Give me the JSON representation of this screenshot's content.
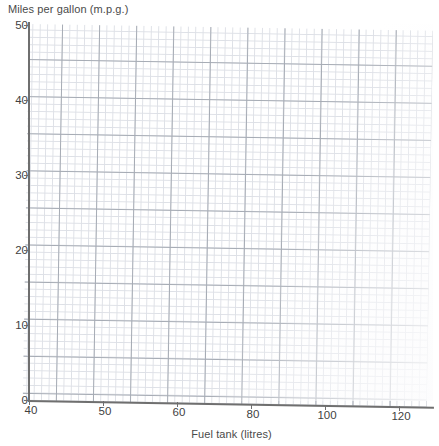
{
  "chart_data": {
    "type": "line",
    "title": "",
    "ylabel": "Miles per gallon (m.p.g.)",
    "xlabel": "Fuel tank (litres)",
    "grid": true,
    "legend": false,
    "series": [],
    "values": [],
    "x": [],
    "categories": [],
    "xlim": [
      40,
      130
    ],
    "ylim": [
      0,
      50
    ],
    "y_ticks": [
      {
        "label": "50",
        "value": 50,
        "top_px": 19
      },
      {
        "label": "40",
        "value": 40,
        "top_px": 94
      },
      {
        "label": "30",
        "value": 30,
        "top_px": 169
      },
      {
        "label": "20",
        "value": 20,
        "top_px": 244
      },
      {
        "label": "10",
        "value": 10,
        "top_px": 319
      },
      {
        "label": "0",
        "value": 0,
        "top_px": 394
      }
    ],
    "x_ticks": [
      {
        "label": "40",
        "value": 40,
        "left_px": 29
      },
      {
        "label": "50",
        "value": 50,
        "left_px": 103
      },
      {
        "label": "60",
        "value": 60,
        "left_px": 177
      },
      {
        "label": "80",
        "value": 80,
        "left_px": 251
      },
      {
        "label": "100",
        "value": 100,
        "left_px": 325
      },
      {
        "label": "120",
        "value": 120,
        "left_px": 399
      }
    ],
    "grid_colors": {
      "minor": "#d9dce3",
      "major": "#9aa0aa",
      "axis": "#6f6f6f",
      "text": "#3f3f3f",
      "background": "#ffffff"
    },
    "annotations": []
  }
}
